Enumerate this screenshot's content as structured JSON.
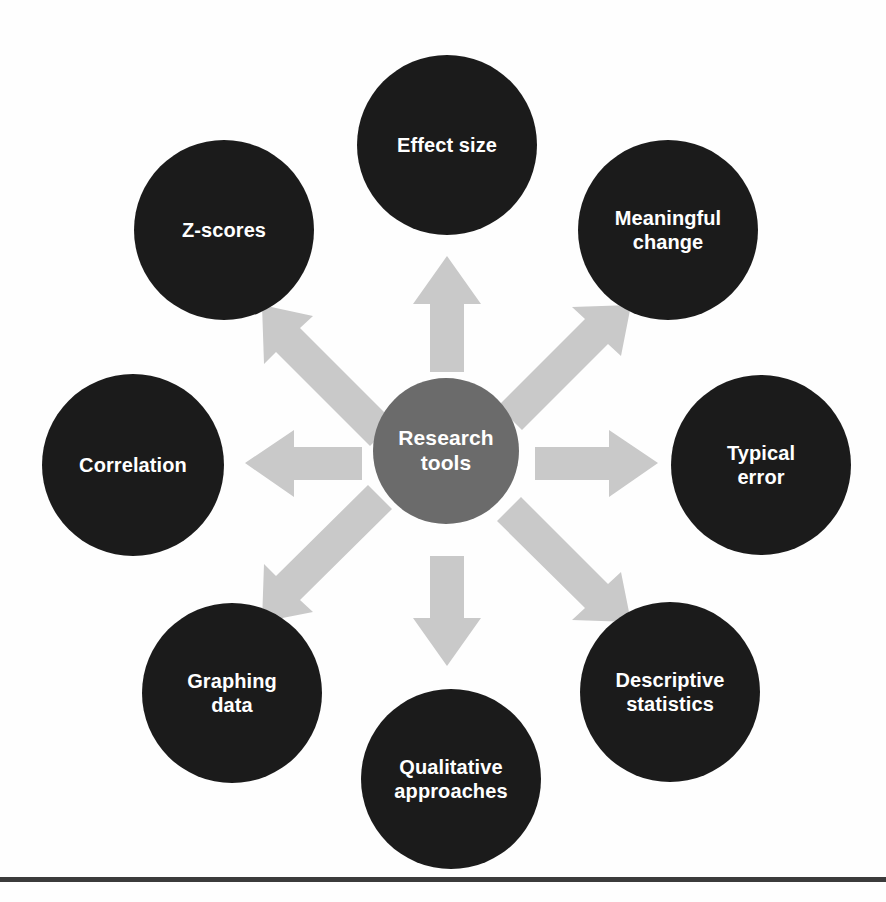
{
  "figure": {
    "type": "hub-and-spoke radial diagram",
    "background_color": "#fefefe",
    "canvas": {
      "width": 886,
      "height": 902
    }
  },
  "hub": {
    "label": "Research\ntools",
    "label_flat": "Research tools",
    "color": "#6b6b6b",
    "text_color": "#ffffff",
    "center": {
      "x": 446,
      "y": 451
    },
    "diameter": 146,
    "font_size": 21
  },
  "nodes": [
    {
      "id": "effect-size",
      "label": "Effect size",
      "color": "#1b1b1b",
      "text_color": "#ffffff",
      "center": {
        "x": 447,
        "y": 145
      },
      "diameter": 180,
      "font_size": 20,
      "direction": "up"
    },
    {
      "id": "meaningful-change",
      "label": "Meaningful\nchange",
      "color": "#1b1b1b",
      "text_color": "#ffffff",
      "center": {
        "x": 668,
        "y": 230
      },
      "diameter": 180,
      "font_size": 20,
      "direction": "up-right"
    },
    {
      "id": "typical-error",
      "label": "Typical\nerror",
      "color": "#1b1b1b",
      "text_color": "#ffffff",
      "center": {
        "x": 761,
        "y": 465
      },
      "diameter": 180,
      "font_size": 20,
      "direction": "right"
    },
    {
      "id": "descriptive-statistics",
      "label": "Descriptive\nstatistics",
      "color": "#1b1b1b",
      "text_color": "#ffffff",
      "center": {
        "x": 670,
        "y": 692
      },
      "diameter": 180,
      "font_size": 20,
      "direction": "down-right"
    },
    {
      "id": "qualitative-approaches",
      "label": "Qualitative\napproaches",
      "color": "#1b1b1b",
      "text_color": "#ffffff",
      "center": {
        "x": 451,
        "y": 779
      },
      "diameter": 180,
      "font_size": 20,
      "direction": "down"
    },
    {
      "id": "graphing-data",
      "label": "Graphing\ndata",
      "color": "#1b1b1b",
      "text_color": "#ffffff",
      "center": {
        "x": 232,
        "y": 693
      },
      "diameter": 180,
      "font_size": 20,
      "direction": "down-left"
    },
    {
      "id": "correlation",
      "label": "Correlation",
      "color": "#1b1b1b",
      "text_color": "#ffffff",
      "center": {
        "x": 133,
        "y": 465
      },
      "diameter": 182,
      "font_size": 20,
      "direction": "left"
    },
    {
      "id": "z-scores",
      "label": "Z-scores",
      "color": "#1b1b1b",
      "text_color": "#ffffff",
      "center": {
        "x": 224,
        "y": 230
      },
      "diameter": 180,
      "font_size": 20,
      "direction": "up-left"
    }
  ],
  "arrows": {
    "color": "#c9c9c9",
    "count": 8,
    "directions": [
      "up",
      "up-right",
      "right",
      "down-right",
      "down",
      "down-left",
      "left",
      "up-left"
    ]
  },
  "bottom_rule": {
    "color": "#3b3b3b",
    "y": 877,
    "height": 5
  }
}
